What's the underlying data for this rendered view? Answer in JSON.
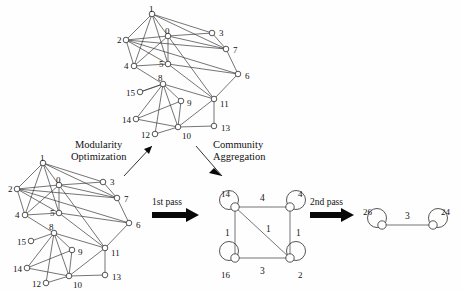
{
  "figure": {
    "background_color": "#fefefe",
    "node_stroke_color": "#2b2b2b",
    "edge_color": "#3a3a3a",
    "text_color": "#111111"
  },
  "captions": {
    "modularity_line1": "Modularity",
    "modularity_line2": "Optimization",
    "community_line1": "Community",
    "community_line2": "Aggregation",
    "first_pass": "1st pass",
    "second_pass": "2nd pass"
  },
  "graph_top": {
    "name": "original-network-top",
    "nodes": [
      {
        "id": "1",
        "x": 152,
        "y": 14,
        "label": "1",
        "lx": 149,
        "ly": 8
      },
      {
        "id": "0",
        "x": 168,
        "y": 36,
        "label": "0",
        "lx": 165,
        "ly": 30
      },
      {
        "id": "3",
        "x": 212,
        "y": 33,
        "label": "3",
        "lx": 219,
        "ly": 32
      },
      {
        "id": "2",
        "x": 126,
        "y": 40,
        "label": "2",
        "lx": 117,
        "ly": 39
      },
      {
        "id": "7",
        "x": 226,
        "y": 49,
        "label": "7",
        "lx": 233,
        "ly": 49
      },
      {
        "id": "4",
        "x": 134,
        "y": 66,
        "label": "4",
        "lx": 124,
        "ly": 65
      },
      {
        "id": "5",
        "x": 168,
        "y": 64,
        "label": "5",
        "lx": 159,
        "ly": 63
      },
      {
        "id": "6",
        "x": 238,
        "y": 74,
        "label": "6",
        "lx": 245,
        "ly": 75
      },
      {
        "id": "8",
        "x": 163,
        "y": 84,
        "label": "8",
        "lx": 158,
        "ly": 77
      },
      {
        "id": "15",
        "x": 140,
        "y": 92,
        "label": "15",
        "lx": 126,
        "ly": 92
      },
      {
        "id": "9",
        "x": 181,
        "y": 101,
        "label": "9",
        "lx": 187,
        "ly": 102
      },
      {
        "id": "11",
        "x": 214,
        "y": 99,
        "label": "11",
        "lx": 220,
        "ly": 103
      },
      {
        "id": "14",
        "x": 136,
        "y": 119,
        "label": "14",
        "lx": 122,
        "ly": 119
      },
      {
        "id": "10",
        "x": 178,
        "y": 127,
        "label": "10",
        "lx": 182,
        "ly": 135
      },
      {
        "id": "13",
        "x": 214,
        "y": 126,
        "label": "13",
        "lx": 221,
        "ly": 127
      },
      {
        "id": "12",
        "x": 155,
        "y": 134,
        "label": "12",
        "lx": 141,
        "ly": 134
      }
    ],
    "edges": [
      [
        "1",
        "0"
      ],
      [
        "1",
        "2"
      ],
      [
        "1",
        "4"
      ],
      [
        "1",
        "5"
      ],
      [
        "1",
        "3"
      ],
      [
        "1",
        "7"
      ],
      [
        "0",
        "2"
      ],
      [
        "0",
        "4"
      ],
      [
        "0",
        "5"
      ],
      [
        "0",
        "3"
      ],
      [
        "0",
        "7"
      ],
      [
        "0",
        "11"
      ],
      [
        "2",
        "4"
      ],
      [
        "2",
        "5"
      ],
      [
        "2",
        "7"
      ],
      [
        "2",
        "6"
      ],
      [
        "3",
        "7"
      ],
      [
        "4",
        "5"
      ],
      [
        "4",
        "8"
      ],
      [
        "5",
        "11"
      ],
      [
        "5",
        "6"
      ],
      [
        "7",
        "6"
      ],
      [
        "6",
        "11"
      ],
      [
        "8",
        "15"
      ],
      [
        "8",
        "9"
      ],
      [
        "8",
        "10"
      ],
      [
        "8",
        "14"
      ],
      [
        "8",
        "12"
      ],
      [
        "8",
        "11"
      ],
      [
        "9",
        "10"
      ],
      [
        "9",
        "14"
      ],
      [
        "10",
        "14"
      ],
      [
        "10",
        "12"
      ],
      [
        "10",
        "11"
      ],
      [
        "10",
        "13"
      ],
      [
        "11",
        "13"
      ],
      [
        "15",
        "8"
      ]
    ]
  },
  "graph_bottom": {
    "name": "original-network-bottom",
    "nodes": [
      {
        "id": "1",
        "x": 43,
        "y": 163,
        "label": "1",
        "lx": 40,
        "ly": 157
      },
      {
        "id": "0",
        "x": 59,
        "y": 185,
        "label": "0",
        "lx": 56,
        "ly": 179
      },
      {
        "id": "3",
        "x": 103,
        "y": 182,
        "label": "3",
        "lx": 110,
        "ly": 181
      },
      {
        "id": "2",
        "x": 17,
        "y": 189,
        "label": "2",
        "lx": 8,
        "ly": 188
      },
      {
        "id": "7",
        "x": 117,
        "y": 198,
        "label": "7",
        "lx": 124,
        "ly": 198
      },
      {
        "id": "4",
        "x": 25,
        "y": 215,
        "label": "4",
        "lx": 15,
        "ly": 214
      },
      {
        "id": "5",
        "x": 59,
        "y": 213,
        "label": "5",
        "lx": 50,
        "ly": 212
      },
      {
        "id": "6",
        "x": 129,
        "y": 223,
        "label": "6",
        "lx": 136,
        "ly": 224
      },
      {
        "id": "8",
        "x": 54,
        "y": 233,
        "label": "8",
        "lx": 49,
        "ly": 226
      },
      {
        "id": "15",
        "x": 31,
        "y": 241,
        "label": "15",
        "lx": 17,
        "ly": 241
      },
      {
        "id": "9",
        "x": 72,
        "y": 250,
        "label": "9",
        "lx": 78,
        "ly": 251
      },
      {
        "id": "11",
        "x": 105,
        "y": 248,
        "label": "11",
        "lx": 111,
        "ly": 252
      },
      {
        "id": "14",
        "x": 27,
        "y": 268,
        "label": "14",
        "lx": 13,
        "ly": 268
      },
      {
        "id": "10",
        "x": 69,
        "y": 276,
        "label": "10",
        "lx": 73,
        "ly": 284
      },
      {
        "id": "13",
        "x": 105,
        "y": 275,
        "label": "13",
        "lx": 112,
        "ly": 276
      },
      {
        "id": "12",
        "x": 46,
        "y": 283,
        "label": "12",
        "lx": 32,
        "ly": 283
      }
    ],
    "edges": [
      [
        "1",
        "0"
      ],
      [
        "1",
        "2"
      ],
      [
        "1",
        "4"
      ],
      [
        "1",
        "5"
      ],
      [
        "1",
        "3"
      ],
      [
        "1",
        "7"
      ],
      [
        "0",
        "2"
      ],
      [
        "0",
        "4"
      ],
      [
        "0",
        "5"
      ],
      [
        "0",
        "3"
      ],
      [
        "0",
        "7"
      ],
      [
        "0",
        "11"
      ],
      [
        "2",
        "4"
      ],
      [
        "2",
        "5"
      ],
      [
        "2",
        "7"
      ],
      [
        "2",
        "6"
      ],
      [
        "3",
        "7"
      ],
      [
        "4",
        "5"
      ],
      [
        "4",
        "8"
      ],
      [
        "5",
        "11"
      ],
      [
        "5",
        "6"
      ],
      [
        "7",
        "6"
      ],
      [
        "6",
        "11"
      ],
      [
        "8",
        "15"
      ],
      [
        "8",
        "9"
      ],
      [
        "8",
        "10"
      ],
      [
        "8",
        "14"
      ],
      [
        "8",
        "12"
      ],
      [
        "8",
        "11"
      ],
      [
        "9",
        "10"
      ],
      [
        "9",
        "14"
      ],
      [
        "10",
        "14"
      ],
      [
        "10",
        "12"
      ],
      [
        "10",
        "11"
      ],
      [
        "10",
        "13"
      ],
      [
        "11",
        "13"
      ]
    ]
  },
  "graph_first_pass": {
    "name": "aggregated-network-first-pass",
    "nodes": [
      {
        "id": "A",
        "x": 235,
        "y": 207,
        "self_weight": "14",
        "lx": 221,
        "ly": 193,
        "loop_cx": 229,
        "loop_cy": 200
      },
      {
        "id": "B",
        "x": 290,
        "y": 207,
        "self_weight": "4",
        "lx": 298,
        "ly": 193,
        "loop_cx": 296,
        "loop_cy": 200
      },
      {
        "id": "C",
        "x": 235,
        "y": 258,
        "self_weight": "16",
        "lx": 221,
        "ly": 274,
        "loop_cx": 229,
        "loop_cy": 251
      },
      {
        "id": "D",
        "x": 290,
        "y": 258,
        "self_weight": "2",
        "lx": 298,
        "ly": 274,
        "loop_cx": 296,
        "loop_cy": 251
      }
    ],
    "edges": [
      {
        "from": "A",
        "to": "B",
        "weight": "4",
        "lx": 260,
        "ly": 201
      },
      {
        "from": "A",
        "to": "C",
        "weight": "1",
        "lx": 225,
        "ly": 236
      },
      {
        "from": "A",
        "to": "D",
        "weight": "1",
        "lx": 266,
        "ly": 232
      },
      {
        "from": "B",
        "to": "D",
        "weight": "1",
        "lx": 296,
        "ly": 236
      },
      {
        "from": "C",
        "to": "D",
        "weight": "3",
        "lx": 260,
        "ly": 274
      }
    ]
  },
  "graph_second_pass": {
    "name": "aggregated-network-second-pass",
    "nodes": [
      {
        "id": "E",
        "x": 382,
        "y": 225,
        "self_weight": "26",
        "lx": 363,
        "ly": 211,
        "loop_cx": 377,
        "loop_cy": 218
      },
      {
        "id": "F",
        "x": 433,
        "y": 225,
        "self_weight": "24",
        "lx": 441,
        "ly": 211,
        "loop_cx": 438,
        "loop_cy": 218
      }
    ],
    "edges": [
      {
        "from": "E",
        "to": "F",
        "weight": "3",
        "lx": 405,
        "ly": 219
      }
    ]
  }
}
